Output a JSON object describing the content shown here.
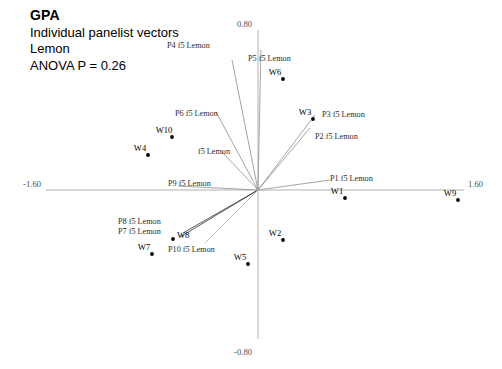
{
  "title": {
    "line1": "GPA",
    "line2": "Individual panelist vectors",
    "line3": "Lemon",
    "line4": "ANOVA P = 0.26"
  },
  "chart_data": {
    "type": "scatter",
    "subtitle": "ANOVA P = 0.26",
    "grid": false,
    "legend": false,
    "xlabel": "",
    "ylabel": "",
    "xlim": [
      -1.6,
      1.6
    ],
    "ylim": [
      -0.8,
      0.8
    ],
    "axis_tick_labels": {
      "x_min": "-1.60",
      "x_max": "1.60",
      "y_max": "0.80",
      "y_min": "-0.80"
    },
    "origin_px": {
      "x": 258,
      "y": 190
    },
    "scale_px": {
      "x_per_unit": 134,
      "y_per_unit": 200
    },
    "vectors": [
      {
        "name": "P1 f5 Lemon",
        "x": 0.537,
        "y": 0.05,
        "color": "#9a9a9a",
        "label": "P1 f5 Lemon",
        "label_x": 330,
        "label_y": 181,
        "anchor": "start"
      },
      {
        "name": "P2 f5 Lemon",
        "x": 0.388,
        "y": 0.31,
        "color": "#9a9a9a",
        "label": "P2 f5 Lemon",
        "label_x": 315,
        "label_y": 139,
        "anchor": "start"
      },
      {
        "name": "P3 f5 Lemon",
        "x": 0.425,
        "y": 0.375,
        "color": "#9a9a9a",
        "label": "P3 f5 Lemon",
        "label_x": 322,
        "label_y": 117,
        "anchor": "start"
      },
      {
        "name": "P4 f5 Lemon",
        "x": -0.194,
        "y": 0.65,
        "color": "#9a9a9a",
        "label": "P4 f5 Lemon",
        "label_x": 167,
        "label_y": 48,
        "anchor": "start"
      },
      {
        "name": "P5 f5 Lemon",
        "x": 0.022,
        "y": 0.7,
        "color": "#9a9a9a",
        "label": "P5 f5 Lemon",
        "label_x": 248,
        "label_y": 61,
        "anchor": "start"
      },
      {
        "name": "P6 f5 Lemon",
        "x": -0.313,
        "y": 0.39,
        "color": "#9a9a9a",
        "label": "P6 f5 Lemon",
        "label_x": 175,
        "label_y": 116,
        "anchor": "start"
      },
      {
        "name": "P7 f5 Lemon",
        "x": -0.582,
        "y": -0.235,
        "color": "#4a4a4a",
        "label": "P7 f5 Lemon",
        "label_x": 118,
        "label_y": 234,
        "anchor": "start"
      },
      {
        "name": "P8 f5 Lemon",
        "x": -0.56,
        "y": -0.215,
        "color": "#4a4a4a",
        "label": "P8 f5 Lemon",
        "label_x": 118,
        "label_y": 224,
        "anchor": "start"
      },
      {
        "name": "P9 f5 Lemon",
        "x": -0.597,
        "y": 0.02,
        "color": "#9a9a9a",
        "label": "P9 f5 Lemon",
        "label_x": 168,
        "label_y": 186,
        "anchor": "start"
      },
      {
        "name": "P10 f5 Lemon",
        "x": -0.396,
        "y": -0.265,
        "color": "#b5b5b5",
        "label": "P10 f5 Lemon",
        "label_x": 168,
        "label_y": 252,
        "anchor": "start"
      },
      {
        "name": "f5 Lemon",
        "x": -0.275,
        "y": 0.195,
        "color": "#9a9a9a",
        "label": "f5 Lemon",
        "label_x": 198,
        "label_y": 154,
        "anchor": "start"
      }
    ],
    "points": [
      {
        "name": "W1",
        "x": 0.649,
        "y": -0.04,
        "px": 345,
        "py": 198,
        "label_dx": -8,
        "label_dy": -4
      },
      {
        "name": "W2",
        "x": 0.187,
        "y": -0.25,
        "px": 283,
        "py": 240,
        "label_dx": -8,
        "label_dy": -4
      },
      {
        "name": "W3",
        "x": 0.41,
        "y": 0.355,
        "px": 313,
        "py": 119,
        "label_dx": -8,
        "label_dy": -4
      },
      {
        "name": "W4",
        "x": -0.821,
        "y": 0.175,
        "px": 148,
        "py": 155,
        "label_dx": -8,
        "label_dy": -4
      },
      {
        "name": "W5",
        "x": -0.075,
        "y": -0.37,
        "px": 248,
        "py": 264,
        "label_dx": -8,
        "label_dy": -4
      },
      {
        "name": "W6",
        "x": 0.187,
        "y": 0.555,
        "px": 283,
        "py": 79,
        "label_dx": -8,
        "label_dy": -4
      },
      {
        "name": "W7",
        "x": -0.791,
        "y": -0.32,
        "px": 152,
        "py": 254,
        "label_dx": -8,
        "label_dy": -4
      },
      {
        "name": "W8",
        "x": -0.634,
        "y": -0.245,
        "px": 173,
        "py": 239,
        "label_dx": 4,
        "label_dy": -1
      },
      {
        "name": "W9",
        "x": 1.493,
        "y": -0.05,
        "px": 458,
        "py": 200,
        "label_dx": -8,
        "label_dy": -4
      },
      {
        "name": "W10",
        "x": -0.642,
        "y": 0.265,
        "px": 172,
        "py": 137,
        "label_dx": -8,
        "label_dy": -4
      }
    ],
    "axes": {
      "x_line": {
        "x1": 46,
        "y1": 190,
        "x2": 464,
        "y2": 190
      },
      "y_line": {
        "x1": 258,
        "y1": 30,
        "x2": 258,
        "y2": 339
      },
      "x_min_label_pos": {
        "x": 41,
        "y": 187
      },
      "x_max_label_pos": {
        "x": 468,
        "y": 187
      },
      "y_max_label_pos": {
        "x": 252,
        "y": 27
      },
      "y_min_label_pos": {
        "x": 252,
        "y": 355
      }
    }
  }
}
